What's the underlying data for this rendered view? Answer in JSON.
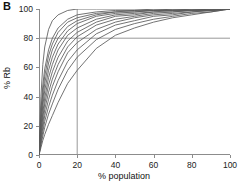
{
  "panel": {
    "label": "B"
  },
  "chart_data": {
    "type": "line",
    "title": "",
    "subtitle": "",
    "xlabel": "% population",
    "ylabel": "% Rb",
    "xlim": [
      0,
      100
    ],
    "ylim": [
      0,
      100
    ],
    "xticks": [
      0,
      20,
      40,
      60,
      80,
      100
    ],
    "yticks": [
      0,
      20,
      40,
      60,
      80,
      100
    ],
    "xtick_labels": [
      "0",
      "20",
      "40",
      "60",
      "80",
      "100"
    ],
    "ytick_labels": [
      "0",
      "20",
      "40",
      "60",
      "80",
      "100"
    ],
    "grid": false,
    "legend": "none",
    "series_color": "#5a5a5a",
    "reference_line_color": "#8c8c8c",
    "annotations": [
      {
        "name": "horizontal-reference-line",
        "axis": "y",
        "value": 80,
        "label": "80% Rb"
      },
      {
        "name": "vertical-reference-line",
        "axis": "x",
        "value": 20,
        "label": "20% population"
      }
    ],
    "x": [
      0,
      1,
      2,
      3,
      5,
      7,
      10,
      15,
      20,
      30,
      40,
      50,
      60,
      70,
      80,
      90,
      100
    ],
    "series": [
      {
        "name": "curve-1",
        "values": [
          0,
          30,
          48,
          59,
          72,
          80,
          87,
          93,
          96,
          98,
          99,
          99,
          100,
          100,
          100,
          100,
          100
        ]
      },
      {
        "name": "curve-2",
        "values": [
          0,
          26,
          43,
          54,
          68,
          76,
          84,
          91,
          94,
          97,
          98,
          99,
          99,
          100,
          100,
          100,
          100
        ]
      },
      {
        "name": "curve-3",
        "values": [
          0,
          22,
          38,
          49,
          63,
          72,
          80,
          88,
          92,
          96,
          98,
          98,
          99,
          99,
          100,
          100,
          100
        ]
      },
      {
        "name": "curve-4",
        "values": [
          0,
          19,
          34,
          44,
          58,
          67,
          76,
          85,
          90,
          95,
          97,
          98,
          99,
          99,
          99,
          100,
          100
        ]
      },
      {
        "name": "curve-5",
        "values": [
          0,
          16,
          29,
          39,
          53,
          62,
          72,
          82,
          87,
          93,
          96,
          97,
          98,
          99,
          99,
          100,
          100
        ]
      },
      {
        "name": "curve-6",
        "values": [
          0,
          14,
          26,
          35,
          48,
          57,
          67,
          78,
          84,
          91,
          95,
          96,
          98,
          98,
          99,
          99,
          100
        ]
      },
      {
        "name": "curve-7",
        "values": [
          0,
          12,
          22,
          31,
          43,
          52,
          62,
          74,
          81,
          89,
          93,
          95,
          97,
          98,
          99,
          99,
          100
        ]
      },
      {
        "name": "curve-8",
        "values": [
          0,
          10,
          19,
          27,
          38,
          47,
          57,
          70,
          77,
          86,
          91,
          94,
          96,
          97,
          98,
          99,
          100
        ]
      },
      {
        "name": "curve-9",
        "values": [
          0,
          8,
          16,
          23,
          33,
          41,
          51,
          64,
          72,
          83,
          89,
          92,
          95,
          96,
          98,
          99,
          100
        ]
      },
      {
        "name": "curve-10",
        "values": [
          0,
          7,
          13,
          19,
          28,
          35,
          45,
          58,
          67,
          79,
          86,
          90,
          93,
          95,
          97,
          98,
          100
        ]
      },
      {
        "name": "curve-11-outlier-steep",
        "values": [
          0,
          40,
          62,
          74,
          86,
          92,
          96,
          99,
          100,
          100,
          100,
          100,
          100,
          100,
          100,
          100,
          100
        ]
      },
      {
        "name": "curve-12-outlier-shallow",
        "values": [
          0,
          5,
          10,
          14,
          21,
          27,
          36,
          49,
          58,
          73,
          82,
          87,
          91,
          94,
          96,
          98,
          100
        ]
      }
    ]
  }
}
